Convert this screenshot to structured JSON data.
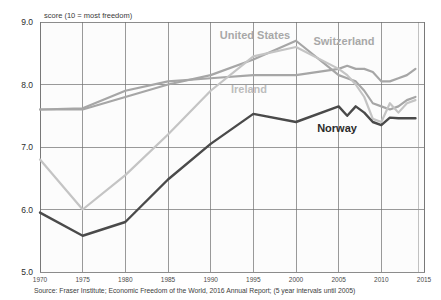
{
  "chart_data": {
    "type": "line",
    "title": "",
    "ylabel": "score (10 = most freedom)",
    "xlabel": "",
    "ylim": [
      5.0,
      9.0
    ],
    "xlim": [
      1970,
      2015
    ],
    "yticks": [
      "5.0",
      "6.0",
      "7.0",
      "8.0",
      "9.0"
    ],
    "ytick_values": [
      5.0,
      6.0,
      7.0,
      8.0,
      9.0
    ],
    "xticks": [
      "1970",
      "1975",
      "1980",
      "1985",
      "1990",
      "1995",
      "2000",
      "2005",
      "2010",
      "2015"
    ],
    "xtick_values": [
      1970,
      1975,
      1980,
      1985,
      1990,
      1995,
      2000,
      2005,
      2010,
      2015
    ],
    "grid": true,
    "legend_position": "inline-annotations",
    "source_note": "Source: Fraser Institute; Economic Freedom of the World, 2016 Annual Report; (5 year intervals until 2005)",
    "series": [
      {
        "name": "United States",
        "color": "#a6a6a6",
        "width": 2.2,
        "label_x": 255,
        "label_y": 39,
        "label_color": "#a8a8a8",
        "x": [
          1970,
          1975,
          1980,
          1985,
          1990,
          1995,
          2000,
          2005,
          2006,
          2007,
          2008,
          2009,
          2010,
          2011,
          2012,
          2013,
          2014
        ],
        "values": [
          7.6,
          7.6,
          7.8,
          8.0,
          8.15,
          8.4,
          8.7,
          8.15,
          8.1,
          8.05,
          7.9,
          7.7,
          7.65,
          7.6,
          7.65,
          7.75,
          7.8
        ]
      },
      {
        "name": "Switzerland",
        "color": "#a6a6a6",
        "width": 2.2,
        "label_x": 344,
        "label_y": 45,
        "label_color": "#a8a8a8",
        "x": [
          1970,
          1975,
          1980,
          1985,
          1990,
          1995,
          2000,
          2005,
          2006,
          2007,
          2008,
          2009,
          2010,
          2011,
          2012,
          2013,
          2014
        ],
        "values": [
          7.6,
          7.62,
          7.9,
          8.05,
          8.1,
          8.15,
          8.15,
          8.25,
          8.3,
          8.25,
          8.25,
          8.2,
          8.05,
          8.05,
          8.1,
          8.15,
          8.25
        ]
      },
      {
        "name": "Ireland",
        "color": "#c4c4c4",
        "width": 2.2,
        "label_x": 249,
        "label_y": 93,
        "label_color": "#bdbdbd",
        "x": [
          1970,
          1975,
          1980,
          1985,
          1990,
          1995,
          2000,
          2005,
          2006,
          2007,
          2008,
          2009,
          2010,
          2011,
          2012,
          2013,
          2014
        ],
        "values": [
          6.8,
          6.0,
          6.55,
          7.2,
          7.9,
          8.45,
          8.6,
          8.25,
          8.15,
          8.0,
          7.8,
          7.45,
          7.4,
          7.7,
          7.55,
          7.7,
          7.75
        ]
      },
      {
        "name": "Norway",
        "color": "#4a4a4a",
        "width": 2.4,
        "label_x": 337,
        "label_y": 132,
        "label_color": "#2b2b2b",
        "x": [
          1970,
          1975,
          1980,
          1985,
          1990,
          1995,
          2000,
          2005,
          2006,
          2007,
          2008,
          2009,
          2010,
          2011,
          2012,
          2013,
          2014
        ],
        "values": [
          5.95,
          5.58,
          5.8,
          6.48,
          7.05,
          7.53,
          7.4,
          7.65,
          7.5,
          7.65,
          7.55,
          7.4,
          7.35,
          7.47,
          7.46,
          7.46,
          7.46
        ]
      }
    ]
  },
  "layout": {
    "plot_left": 40,
    "plot_right": 424,
    "plot_top": 22,
    "plot_bottom": 272,
    "extra_vline_x": 418
  }
}
